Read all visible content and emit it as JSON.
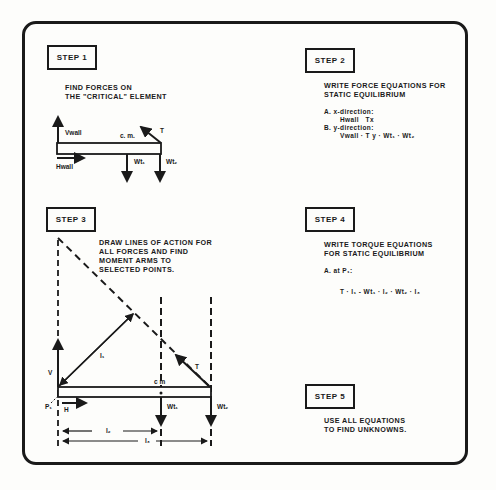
{
  "steps": [
    {
      "label": "STEP 1",
      "lines": [
        "FIND FORCES ON",
        "THE \"CRITICAL\" ELEMENT"
      ]
    },
    {
      "label": "STEP 2",
      "lines": [
        "WRITE FORCE EQUATIONS FOR",
        "STATIC EQUILIBRIUM"
      ],
      "equations": {
        "a_label": "A. x-direction:",
        "a_eq": "Hwall   Tx",
        "b_label": "B. y-direction:",
        "b_eq": "Vwall · T y · Wt₁ · Wt₂"
      }
    },
    {
      "label": "STEP 3",
      "lines": [
        "DRAW LINES OF ACTION FOR",
        "ALL FORCES AND FIND",
        "MOMENT ARMS TO",
        "SELECTED POINTS."
      ]
    },
    {
      "label": "STEP 4",
      "lines": [
        "WRITE TORQUE EQUATIONS",
        "FOR STATIC EQUILIBRIUM"
      ],
      "equations": {
        "a_label": "A. at P₁:",
        "a_eq": "T · l₁ - Wt₁ · l₂ · Wt₂ · l₃"
      }
    },
    {
      "label": "STEP 5",
      "lines": [
        "USE ALL EQUATIONS",
        "TO FIND UNKNOWNS."
      ]
    }
  ],
  "diagram1": {
    "v_label": "Vwall",
    "h_label": "Hwall",
    "cm_label": "c. m.",
    "t_label": "T",
    "w1_label": "Wt₁",
    "w2_label": "Wt₂"
  },
  "diagram3": {
    "v_label": "V",
    "h_label": "H",
    "p_label": "P₁",
    "cm_label": "c m",
    "t_label": "T",
    "l1_label": "l₁",
    "l2_label": "l₂",
    "l3_label": "l₃",
    "w1_label": "Wt₁",
    "w2_label": "Wt₂"
  }
}
